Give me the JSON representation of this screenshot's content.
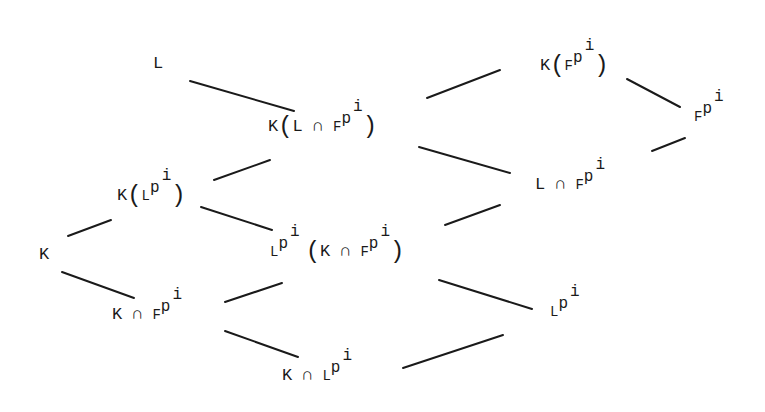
{
  "diagram": {
    "type": "field-lattice",
    "nodes": [
      {
        "id": "L",
        "label": "L",
        "x": 155,
        "y": 55
      },
      {
        "id": "K_L_cap_Fpi",
        "label": "K(L ∩ F^{p^i})",
        "x": 268,
        "y": 112
      },
      {
        "id": "K_Fpi",
        "label": "K(F^{p^i})",
        "x": 540,
        "y": 35
      },
      {
        "id": "Fpi",
        "label": "F^{p^i}",
        "x": 695,
        "y": 92
      },
      {
        "id": "L_cap_Fpi",
        "label": "L ∩ F^{p^i}",
        "x": 535,
        "y": 172
      },
      {
        "id": "K_Lpi",
        "label": "K(L^{p^i})",
        "x": 117,
        "y": 175
      },
      {
        "id": "K",
        "label": "K",
        "x": 40,
        "y": 246
      },
      {
        "id": "Lpi_K_cap_Fpi",
        "label": "L^{p^i}(K ∩ F^{p^i})",
        "x": 270,
        "y": 232
      },
      {
        "id": "K_cap_Fpi",
        "label": "K ∩ F^{p^i}",
        "x": 112,
        "y": 300
      },
      {
        "id": "Lpi",
        "label": "L^{p^i}",
        "x": 550,
        "y": 297
      },
      {
        "id": "K_cap_Lpi",
        "label": "K ∩ L^{p^i}",
        "x": 282,
        "y": 361
      }
    ],
    "edges": [
      {
        "from": "L",
        "to": "K_L_cap_Fpi",
        "x1": 190,
        "y1": 81,
        "x2": 294,
        "y2": 111
      },
      {
        "from": "K_L_cap_Fpi",
        "to": "K_Fpi",
        "x1": 427,
        "y1": 98,
        "x2": 500,
        "y2": 70
      },
      {
        "from": "K_Fpi",
        "to": "Fpi",
        "x1": 627,
        "y1": 79,
        "x2": 680,
        "y2": 107
      },
      {
        "from": "K_L_cap_Fpi",
        "to": "L_cap_Fpi",
        "x1": 419,
        "y1": 147,
        "x2": 510,
        "y2": 173
      },
      {
        "from": "L_cap_Fpi",
        "to": "Fpi",
        "x1": 652,
        "y1": 151,
        "x2": 685,
        "y2": 138
      },
      {
        "from": "K_Lpi",
        "to": "K_L_cap_Fpi",
        "x1": 214,
        "y1": 180,
        "x2": 270,
        "y2": 160
      },
      {
        "from": "K_Lpi",
        "to": "Lpi_K_cap_Fpi",
        "x1": 201,
        "y1": 207,
        "x2": 272,
        "y2": 230
      },
      {
        "from": "K",
        "to": "K_Lpi",
        "x1": 68,
        "y1": 236,
        "x2": 111,
        "y2": 220
      },
      {
        "from": "K",
        "to": "K_cap_Fpi",
        "x1": 62,
        "y1": 272,
        "x2": 134,
        "y2": 298
      },
      {
        "from": "K_cap_Fpi",
        "to": "Lpi_K_cap_Fpi",
        "x1": 225,
        "y1": 302,
        "x2": 282,
        "y2": 283
      },
      {
        "from": "Lpi_K_cap_Fpi",
        "to": "L_cap_Fpi",
        "x1": 445,
        "y1": 225,
        "x2": 500,
        "y2": 205
      },
      {
        "from": "Lpi_K_cap_Fpi",
        "to": "Lpi",
        "x1": 439,
        "y1": 280,
        "x2": 532,
        "y2": 309
      },
      {
        "from": "K_cap_Fpi",
        "to": "K_cap_Lpi",
        "x1": 225,
        "y1": 331,
        "x2": 298,
        "y2": 357
      },
      {
        "from": "K_cap_Lpi",
        "to": "Lpi",
        "x1": 403,
        "y1": 368,
        "x2": 503,
        "y2": 335
      }
    ]
  },
  "glyphs": {
    "K": "K",
    "L": "L",
    "F": "F",
    "p": "p",
    "i": "i",
    "cap": "∩",
    "lparen": "(",
    "rparen": ")"
  },
  "colors": {
    "ink": "#1a1a1a",
    "background": "#ffffff"
  }
}
